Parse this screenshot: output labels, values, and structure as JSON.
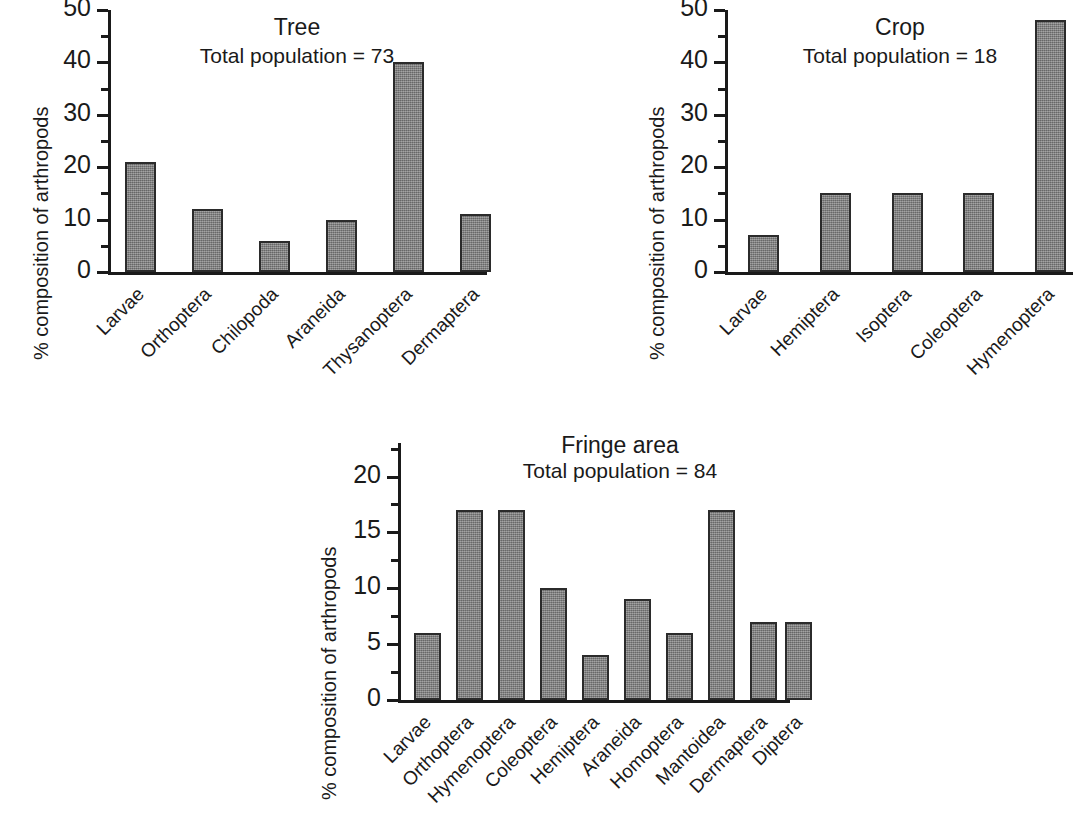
{
  "figure": {
    "ylabel": "% composition of arthropods",
    "bar_color": "#7d7d7d",
    "bar_edge_color": "#2b2b2b",
    "axis_color": "#1a1a1a",
    "background": "#ffffff"
  },
  "chart_data": [
    {
      "type": "bar",
      "title": "Tree",
      "subtitle": "Total population = 73",
      "xlabel": "",
      "ylabel": "% composition of arthropods",
      "categories": [
        "Larvae",
        "Orthoptera",
        "Chilopoda",
        "Araneida",
        "Thysanoptera",
        "Dermaptera"
      ],
      "values": [
        21,
        12,
        6,
        10,
        40,
        11
      ],
      "ylim": [
        0,
        50
      ],
      "yticks": [
        0,
        10,
        20,
        30,
        40,
        50
      ],
      "ytick_labels": [
        "0",
        "10",
        "20",
        "30",
        "40",
        "50"
      ],
      "minor_ytick_step": 5,
      "grid": false,
      "legend": "none"
    },
    {
      "type": "bar",
      "title": "Crop",
      "subtitle": "Total population = 18",
      "xlabel": "",
      "ylabel": "% composition of arthropods",
      "categories": [
        "Larvae",
        "Hemiptera",
        "Isoptera",
        "Coleoptera",
        "Hymenoptera"
      ],
      "values": [
        7,
        15,
        15,
        15,
        48
      ],
      "ylim": [
        0,
        50
      ],
      "yticks": [
        0,
        10,
        20,
        30,
        40,
        50
      ],
      "ytick_labels": [
        "0",
        "10",
        "20",
        "30",
        "40",
        "50"
      ],
      "minor_ytick_step": 5,
      "grid": false,
      "legend": "none"
    },
    {
      "type": "bar",
      "title": "Fringe area",
      "subtitle": "Total population = 84",
      "xlabel": "",
      "ylabel": "% composition of arthropods",
      "categories": [
        "Larvae",
        "Orthoptera",
        "Hymenoptera",
        "Coleoptera",
        "Hemiptera",
        "Araneida",
        "Homoptera",
        "Mantoidea",
        "Dermaptera",
        "Diptera"
      ],
      "values": [
        6,
        17,
        17,
        10,
        4,
        9,
        6,
        17,
        7,
        7
      ],
      "ylim": [
        0,
        23
      ],
      "yticks": [
        0,
        5,
        10,
        15,
        20
      ],
      "ytick_labels": [
        "0",
        "5",
        "10",
        "15",
        "20"
      ],
      "minor_ytick_step": 2.5,
      "grid": false,
      "legend": "none"
    }
  ]
}
